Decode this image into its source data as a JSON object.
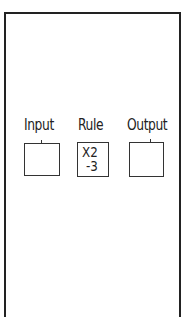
{
  "diagram": {
    "type": "function-machine",
    "columns": [
      {
        "label": "Input",
        "content": []
      },
      {
        "label": "Rule",
        "content": [
          "X2",
          "-3"
        ]
      },
      {
        "label": "Output",
        "content": []
      }
    ]
  }
}
